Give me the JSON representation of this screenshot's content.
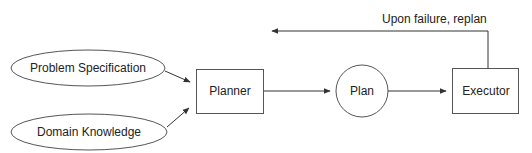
{
  "diagram": {
    "inputs": [
      {
        "label": "Problem Specification"
      },
      {
        "label": "Domain Knowledge"
      }
    ],
    "planner": {
      "label": "Planner"
    },
    "plan": {
      "label": "Plan"
    },
    "executor": {
      "label": "Executor"
    },
    "feedback": {
      "label": "Upon failure, replan"
    }
  },
  "colors": {
    "stroke": "#333333",
    "text": "#222222",
    "background": "#ffffff"
  }
}
